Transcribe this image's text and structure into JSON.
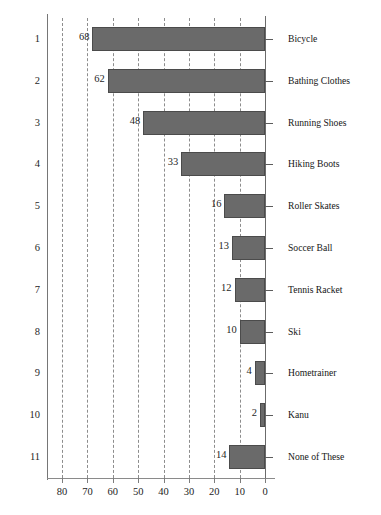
{
  "chart_data": {
    "type": "bar",
    "orientation": "horizontal",
    "title": "",
    "subtitle": "",
    "xlabel": "",
    "ylabel": "",
    "xlim": [
      80,
      0
    ],
    "x_axis_reversed": true,
    "grid": true,
    "grid_style": "dashed-vertical",
    "legend": "none",
    "bar_color": "#6a6a6a",
    "bar_border_color": "#4b4b4b",
    "axis_color": "#7d7d7d",
    "categories": [
      "Bicycle",
      "Bathing Clothes",
      "Running Shoes",
      "Hiking Boots",
      "Roller Skates",
      "Soccer Ball",
      "Tennis Racket",
      "Ski",
      "Hometrainer",
      "Kanu",
      "None of These"
    ],
    "values": [
      68,
      62,
      48,
      33,
      16,
      13,
      12,
      10,
      4,
      2,
      14
    ],
    "row_numbers": [
      "1",
      "2",
      "3",
      "4",
      "5",
      "6",
      "7",
      "8",
      "9",
      "10",
      "11"
    ],
    "data_labels": [
      "68",
      "62",
      "48",
      "33",
      "16",
      "13",
      "12",
      "10",
      "4",
      "2",
      "14"
    ],
    "xticks": [
      80,
      70,
      60,
      50,
      40,
      30,
      20,
      10,
      0
    ],
    "xtick_labels": [
      "80",
      "70",
      "60",
      "50",
      "40",
      "30",
      "20",
      "10",
      "0"
    ]
  }
}
